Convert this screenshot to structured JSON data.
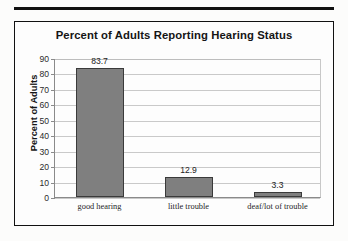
{
  "chart_data": {
    "type": "bar",
    "title": "Percent of Adults Reporting Hearing Status",
    "xlabel": "",
    "ylabel": "Percent of Adults",
    "categories": [
      "good hearing",
      "little trouble",
      "deaf/lot of trouble"
    ],
    "values": [
      83.7,
      12.9,
      3.3
    ],
    "value_labels": [
      "83.7",
      "12.9",
      "3.3"
    ],
    "ylim": [
      0,
      90
    ],
    "ytick_step": 10,
    "ytick_labels": [
      "90",
      "80",
      "70",
      "60",
      "50",
      "40",
      "30",
      "20",
      "10",
      "0"
    ],
    "grid": true,
    "grid_axis": "y",
    "legend": false,
    "bar_color": "#7f7f7f",
    "bar_border_color": "#3a3a3a",
    "grid_color": "#c9c9c9",
    "axis_color": "#8a8a8a",
    "text_color": "#1d1d1d"
  }
}
